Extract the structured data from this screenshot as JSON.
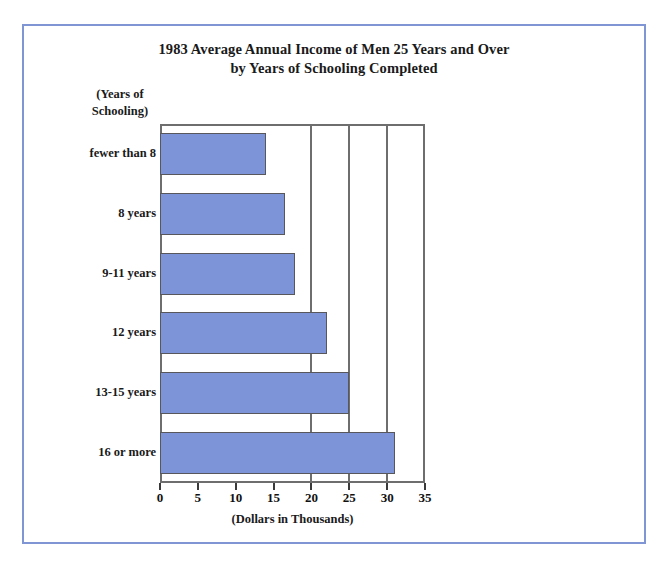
{
  "chart_data": {
    "type": "bar",
    "orientation": "horizontal",
    "title": "1983 Average Annual Income of Men 25 Years and Over by Years of Schooling Completed",
    "title_lines": [
      "1983 Average Annual Income of Men 25 Years and Over",
      "by Years of Schooling Completed"
    ],
    "ylabel_lines": [
      "(Years of",
      "Schooling)"
    ],
    "ylabel": "(Years of Schooling)",
    "xlabel": "(Dollars in Thousands)",
    "categories": [
      "fewer than 8",
      "8 years",
      "9-11 years",
      "12 years",
      "13-15 years",
      "16 or more"
    ],
    "values": [
      14,
      16.5,
      17.8,
      22,
      25,
      31
    ],
    "xlim": [
      0,
      35
    ],
    "xticks": [
      0,
      5,
      10,
      15,
      20,
      25,
      30,
      35
    ],
    "xtick_labels": [
      "0",
      "5",
      "10",
      "15",
      "20",
      "25",
      "30",
      "35"
    ],
    "grid": true,
    "gridlines_at": [
      20,
      25,
      30
    ],
    "legend": null,
    "bar_color": "#7d94d8",
    "bar_border_color": "#58585c",
    "axis_color": "#6e6e6e",
    "frame_color": "#7f95d4"
  }
}
